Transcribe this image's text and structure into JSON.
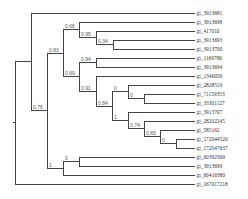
{
  "diagram": {
    "type": "phylogenetic-tree",
    "line_color": "#444444",
    "label_color": "#333333",
    "leaf_end_x": 195,
    "leaves": [
      {
        "id": "L1",
        "label": "gi_3913681",
        "y": 13
      },
      {
        "id": "L2",
        "label": "gi_3913698",
        "y": 22
      },
      {
        "id": "L3",
        "label": "gi_417010",
        "y": 31
      },
      {
        "id": "L4",
        "label": "gi_3913693",
        "y": 40
      },
      {
        "id": "L5",
        "label": "gi_3913700",
        "y": 49
      },
      {
        "id": "L6",
        "label": "gi_1169780",
        "y": 58
      },
      {
        "id": "L7",
        "label": "gi_3913694",
        "y": 67
      },
      {
        "id": "L8",
        "label": "gi_1346056",
        "y": 76
      },
      {
        "id": "L9",
        "label": "gi_2828519",
        "y": 85
      },
      {
        "id": "L10",
        "label": "gi_71159353",
        "y": 94
      },
      {
        "id": "L11",
        "label": "gi_33301127",
        "y": 103
      },
      {
        "id": "L12",
        "label": "gi_3913707",
        "y": 112
      },
      {
        "id": "L13",
        "label": "gi_28202245",
        "y": 121
      },
      {
        "id": "L14",
        "label": "gi_585162",
        "y": 130
      },
      {
        "id": "L15",
        "label": "gi_172044520",
        "y": 139
      },
      {
        "id": "L16",
        "label": "gi_172047637",
        "y": 148
      },
      {
        "id": "L17",
        "label": "gi_60392309",
        "y": 157
      },
      {
        "id": "L18",
        "label": "gi_3913699",
        "y": 166
      },
      {
        "id": "L19",
        "label": "gi_60416380",
        "y": 175
      },
      {
        "id": "L20",
        "label": "gi_167017218",
        "y": 184
      }
    ],
    "nodes": [
      {
        "id": "n034",
        "x": 113,
        "children": [
          "L4",
          "L5"
        ],
        "support": "0.34"
      },
      {
        "id": "n095",
        "x": 96,
        "children": [
          "L3",
          "n034"
        ],
        "support": "0.95"
      },
      {
        "id": "n066",
        "x": 79,
        "children": [
          "L2",
          "n095"
        ],
        "support": "0.66"
      },
      {
        "id": "n094",
        "x": 96,
        "children": [
          "L6",
          "L7"
        ],
        "support": "0.94"
      },
      {
        "id": "n0a",
        "x": 144,
        "children": [
          "L10",
          "L11"
        ],
        "support": "0"
      },
      {
        "id": "n0b",
        "x": 128,
        "children": [
          "L9",
          "n0a"
        ],
        "support": "0"
      },
      {
        "id": "n0c",
        "x": 176,
        "children": [
          "L15",
          "L16"
        ],
        "support": "0"
      },
      {
        "id": "n089",
        "x": 160,
        "children": [
          "L14",
          "n0c"
        ],
        "support": "0.89"
      },
      {
        "id": "n074",
        "x": 144,
        "children": [
          "L13",
          "n089"
        ],
        "support": "0.74"
      },
      {
        "id": "n1a",
        "x": 128,
        "children": [
          "L12",
          "n074"
        ],
        "support": "1"
      },
      {
        "id": "n084",
        "x": 112,
        "children": [
          "n0b",
          "n1a"
        ],
        "support": "0.84"
      },
      {
        "id": "n091",
        "x": 96,
        "children": [
          "L8",
          "n084"
        ],
        "support": "0.91"
      },
      {
        "id": "n069",
        "x": 79,
        "children": [
          "n094",
          "n091"
        ],
        "support": "0.69"
      },
      {
        "id": "n083",
        "x": 63,
        "children": [
          "n066",
          "n069"
        ],
        "support": "0.83"
      },
      {
        "id": "n0d",
        "x": 79,
        "children": [
          "L17",
          "L18"
        ],
        "support": "0"
      },
      {
        "id": "n1b",
        "x": 63,
        "children": [
          "n0d",
          "L19"
        ],
        "support": "1"
      },
      {
        "id": "n076",
        "x": 47,
        "children": [
          "n083",
          "n1b"
        ],
        "support": "0.76"
      },
      {
        "id": "ntop",
        "x": 31,
        "children": [
          "L1",
          "n076"
        ],
        "support": ""
      },
      {
        "id": "root",
        "x": 15,
        "children": [
          "ntop",
          "L20"
        ],
        "support": ""
      }
    ]
  }
}
